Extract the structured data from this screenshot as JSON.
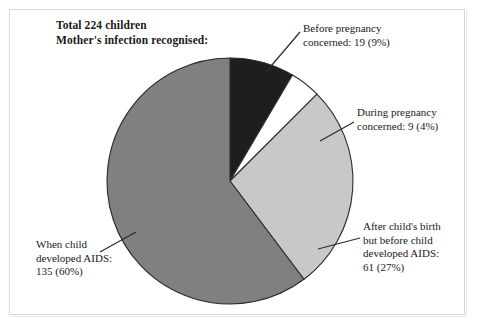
{
  "title": {
    "line1": "Total 224 children",
    "line2": "Mother's infection recognised:"
  },
  "chart_data": {
    "type": "pie",
    "total": 224,
    "total_label": "Total 224 children",
    "units": "children",
    "grid": false,
    "legend_position": "callouts",
    "start_angle_deg": 0,
    "direction": "clockwise",
    "categories": [
      "Before pregnancy concerned",
      "During pregnancy concerned",
      "After child's birth but before child developed AIDS",
      "When child developed AIDS"
    ],
    "values": [
      19,
      9,
      61,
      135
    ],
    "percents": [
      9,
      4,
      27,
      60
    ],
    "colors": [
      "#1e1e1e",
      "#c8c8c8",
      "#ffffff",
      "#808080"
    ],
    "slices": [
      {
        "name": "before-pregnancy",
        "value": 19,
        "percent": 9,
        "color": "#1e1e1e",
        "exploded": false,
        "label_lines": [
          "Before pregnancy",
          "concerned: 19 (9%)"
        ]
      },
      {
        "name": "during-pregnancy",
        "value": 9,
        "percent": 4,
        "color": "#ffffff",
        "exploded": false,
        "label_lines": [
          "During pregnancy",
          "concerned: 9 (4%)"
        ]
      },
      {
        "name": "after-childs-birth",
        "value": 61,
        "percent": 27,
        "color": "#c8c8c8",
        "exploded": false,
        "label_lines": [
          "After child's birth",
          "but before child",
          "developed AIDS:",
          "61 (27%)"
        ]
      },
      {
        "name": "when-child-developed-aids",
        "value": 135,
        "percent": 60,
        "color": "#808080",
        "exploded": false,
        "label_lines": [
          "When child",
          "developed AIDS:",
          "135 (60%)"
        ]
      }
    ]
  },
  "callouts": {
    "before": {
      "l1": "Before pregnancy",
      "l2": "concerned: 19 (9%)"
    },
    "during": {
      "l1": "During pregnancy",
      "l2": "concerned: 9 (4%)"
    },
    "after": {
      "l1": "After child's birth",
      "l2": "but before child",
      "l3": "developed AIDS:",
      "l4": "61 (27%)"
    },
    "when": {
      "l1": "When child",
      "l2": "developed AIDS:",
      "l3": "135 (60%)"
    }
  },
  "colors": {
    "slice_dark": "#1e1e1e",
    "slice_light_gray": "#c8c8c8",
    "slice_white": "#ffffff",
    "slice_medium_gray": "#808080",
    "outline": "#2b2b2b",
    "text": "#1a1a1a",
    "frame": "#d8d8d8"
  }
}
